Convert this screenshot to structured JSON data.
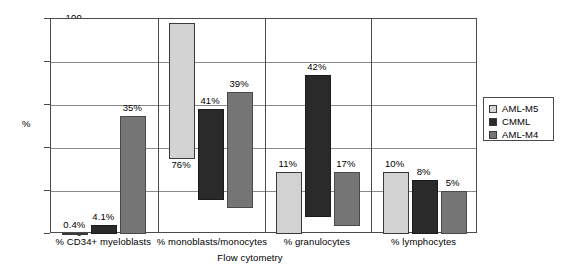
{
  "chart_data": {
    "type": "bar",
    "bar_style": "floating-range",
    "title": "",
    "xlabel": "Flow cytometry",
    "ylabel": "%",
    "ylim": [
      0,
      100
    ],
    "yticks": [
      0,
      20,
      40,
      60,
      80,
      100
    ],
    "ytick_labels": [
      "0",
      "20",
      "40",
      "60",
      "80",
      "100"
    ],
    "grid": true,
    "legend_position": "right",
    "categories": [
      "% CD34+ myeloblasts",
      "% monoblasts/monocytes",
      "% granulocytes",
      "% lymphocytes"
    ],
    "series": [
      {
        "name": "AML-M5",
        "color": "#d2d2d2",
        "low": [
          0,
          35,
          0,
          0
        ],
        "high": [
          0.4,
          98,
          29,
          29
        ],
        "labels": [
          "0.4%",
          "76%",
          "11%",
          "10%"
        ]
      },
      {
        "name": "CMML",
        "color": "#2a2a2a",
        "low": [
          0,
          16,
          8,
          0
        ],
        "high": [
          4.1,
          58,
          74,
          25
        ],
        "labels": [
          "4.1%",
          "41%",
          "42%",
          "8%"
        ]
      },
      {
        "name": "AML-M4",
        "color": "#757575",
        "low": [
          0,
          12,
          3.5,
          0
        ],
        "high": [
          55,
          66,
          29,
          20
        ],
        "labels": [
          "35%",
          "39%",
          "17%",
          "5%"
        ]
      }
    ]
  },
  "legend": {
    "items": [
      {
        "label": "AML-M5"
      },
      {
        "label": "CMML"
      },
      {
        "label": "AML-M4"
      }
    ]
  }
}
